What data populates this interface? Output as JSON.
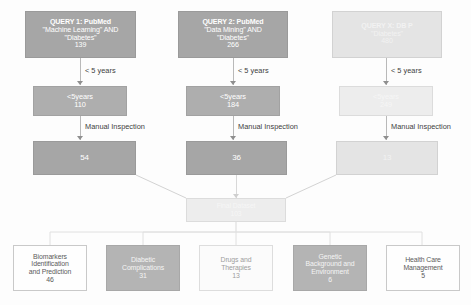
{
  "diagram": {
    "colors": {
      "box_dark": "#a6a6a6",
      "box_faint": "#e4e4e4",
      "box_white": "#fefefe",
      "connector": "#b9b9b9",
      "text_on_dark": "#ffffff",
      "text_dark": "#3d3d3d"
    },
    "queries": [
      {
        "id": "query-1",
        "title": "QUERY 1: PubMed",
        "term_1": "\"Machine Learning\" AND",
        "term_2": "\"Diabetes\"",
        "count": "139"
      },
      {
        "id": "query-2",
        "title": "QUERY 2: PubMed",
        "term_1": "\"Data Mining\" AND",
        "term_2": "\"Diabetes\"",
        "count": "266"
      },
      {
        "id": "query-3",
        "title": "QUERY X: DB P",
        "term_1": "\"Diabetes\"",
        "term_2": "",
        "count": "480"
      }
    ],
    "filter_labels": [
      "< 5 years",
      "< 5 years",
      "< 5 years"
    ],
    "year_filter_boxes": [
      {
        "label": "<5years",
        "count": "110"
      },
      {
        "label": "<5years",
        "count": "184"
      },
      {
        "label": "<5years",
        "count": "249"
      }
    ],
    "inspection_labels": [
      "Manual Inspection",
      "Manual Inspection",
      "Manual Inspection"
    ],
    "inspection_result_boxes": [
      {
        "count": "54"
      },
      {
        "count": "36"
      },
      {
        "count": "13"
      }
    ],
    "merge_box": {
      "label": "Final Dataset",
      "count": "103"
    },
    "categories": [
      {
        "line_1": "Biomarkers",
        "line_2": "Identification",
        "line_3": "and Prediction",
        "count": "46"
      },
      {
        "line_1": "Diabetic",
        "line_2": "Complications",
        "line_3": "",
        "count": "31"
      },
      {
        "line_1": "Drugs and",
        "line_2": "Therapies",
        "line_3": "",
        "count": "13"
      },
      {
        "line_1": "Genetic",
        "line_2": "Background and",
        "line_3": "Environment",
        "count": "6"
      },
      {
        "line_1": "Health Care",
        "line_2": "Management",
        "line_3": "",
        "count": "5"
      }
    ]
  }
}
